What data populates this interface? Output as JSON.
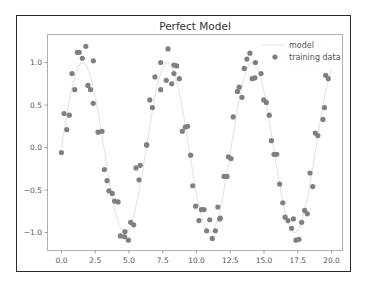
{
  "chart_data": {
    "type": "scatter",
    "title": "Perfect Model",
    "xlabel": "",
    "ylabel": "",
    "xlim": [
      -1.0,
      20.8
    ],
    "ylim": [
      -1.35,
      1.33
    ],
    "x_ticks": [
      "0.0",
      "2.5",
      "5.0",
      "7.5",
      "10.0",
      "12.5",
      "15.0",
      "17.5",
      "20.0"
    ],
    "y_ticks": [
      "-1.0",
      "-0.5",
      "0.0",
      "0.5",
      "1.0"
    ],
    "grid": false,
    "legend": {
      "position": "upper right",
      "entries": [
        "model",
        "training data"
      ]
    },
    "series": [
      {
        "name": "model",
        "type": "line",
        "color": "#e6e6e6",
        "function": "sin(x)",
        "x_range": [
          0,
          20
        ]
      },
      {
        "name": "training data",
        "type": "scatter",
        "color": "#808080",
        "points": [
          [
            -0.01,
            -0.06
          ],
          [
            0.19,
            0.4
          ],
          [
            0.58,
            0.38
          ],
          [
            0.39,
            0.21
          ],
          [
            0.78,
            0.87
          ],
          [
            0.98,
            0.68
          ],
          [
            1.17,
            1.12
          ],
          [
            1.31,
            1.12
          ],
          [
            1.54,
            1.05
          ],
          [
            1.8,
            1.19
          ],
          [
            1.96,
            0.73
          ],
          [
            2.15,
            0.68
          ],
          [
            2.36,
            1.02
          ],
          [
            2.35,
            0.52
          ],
          [
            2.71,
            0.18
          ],
          [
            3.0,
            0.19
          ],
          [
            3.17,
            -0.26
          ],
          [
            3.37,
            -0.39
          ],
          [
            3.51,
            -0.51
          ],
          [
            3.76,
            -0.54
          ],
          [
            3.93,
            -0.63
          ],
          [
            4.19,
            -0.64
          ],
          [
            4.36,
            -1.04
          ],
          [
            4.67,
            -1.05
          ],
          [
            4.7,
            -0.99
          ],
          [
            4.96,
            -1.09
          ],
          [
            5.12,
            -0.88
          ],
          [
            5.35,
            -0.91
          ],
          [
            5.52,
            -0.24
          ],
          [
            5.74,
            -0.38
          ],
          [
            5.83,
            -0.21
          ],
          [
            6.31,
            0.03
          ],
          [
            6.31,
            0.03
          ],
          [
            6.54,
            0.56
          ],
          [
            6.73,
            0.47
          ],
          [
            6.92,
            0.83
          ],
          [
            7.35,
            0.68
          ],
          [
            7.35,
            1.0
          ],
          [
            7.76,
            0.79
          ],
          [
            7.89,
            1.16
          ],
          [
            8.16,
            0.75
          ],
          [
            8.33,
            0.87
          ],
          [
            8.33,
            0.97
          ],
          [
            8.53,
            0.96
          ],
          [
            8.73,
            0.81
          ],
          [
            8.95,
            0.19
          ],
          [
            9.17,
            0.24
          ],
          [
            9.35,
            0.25
          ],
          [
            9.57,
            -0.09
          ],
          [
            9.72,
            -0.45
          ],
          [
            9.94,
            -0.69
          ],
          [
            10.18,
            -0.86
          ],
          [
            10.36,
            -0.73
          ],
          [
            10.56,
            -0.73
          ],
          [
            10.75,
            -0.98
          ],
          [
            10.98,
            -0.85
          ],
          [
            11.17,
            -1.07
          ],
          [
            11.4,
            -0.98
          ],
          [
            11.58,
            -0.7
          ],
          [
            11.72,
            -0.84
          ],
          [
            11.77,
            -0.83
          ],
          [
            12.04,
            -0.34
          ],
          [
            12.26,
            -0.34
          ],
          [
            12.36,
            -0.11
          ],
          [
            12.56,
            -0.13
          ],
          [
            12.72,
            0.36
          ],
          [
            13.03,
            0.66
          ],
          [
            13.16,
            0.71
          ],
          [
            13.37,
            0.59
          ],
          [
            13.54,
            0.93
          ],
          [
            13.73,
            1.04
          ],
          [
            13.96,
            1.11
          ],
          [
            14.13,
            0.81
          ],
          [
            14.33,
            0.82
          ],
          [
            14.36,
            1.0
          ],
          [
            14.78,
            0.87
          ],
          [
            14.98,
            0.56
          ],
          [
            15.17,
            0.53
          ],
          [
            15.39,
            0.38
          ],
          [
            15.55,
            0.08
          ],
          [
            15.74,
            -0.08
          ],
          [
            15.94,
            -0.08
          ],
          [
            16.16,
            -0.43
          ],
          [
            16.39,
            -0.65
          ],
          [
            16.56,
            -0.82
          ],
          [
            16.78,
            -0.86
          ],
          [
            17.04,
            -0.95
          ],
          [
            17.18,
            -0.84
          ],
          [
            17.37,
            -1.09
          ],
          [
            17.59,
            -1.08
          ],
          [
            17.79,
            -0.88
          ],
          [
            18.01,
            -0.74
          ],
          [
            18.21,
            -0.78
          ],
          [
            18.41,
            -0.3
          ],
          [
            18.61,
            -0.46
          ],
          [
            18.8,
            0.17
          ],
          [
            18.99,
            0.14
          ],
          [
            19.37,
            0.33
          ],
          [
            19.48,
            0.47
          ],
          [
            19.57,
            0.85
          ],
          [
            19.76,
            0.81
          ]
        ]
      }
    ]
  }
}
